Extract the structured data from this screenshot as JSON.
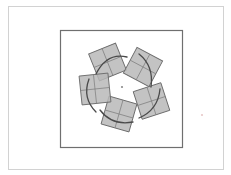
{
  "figure": {
    "canvas": {
      "width": 231,
      "height": 175,
      "background": "#ffffff"
    },
    "page_border": {
      "label": "page-border",
      "x": 8,
      "y": 6,
      "width": 215,
      "height": 163,
      "stroke": "#d2d2d2",
      "stroke_width": 1,
      "fill": "none"
    },
    "inner_frame": {
      "label": "inner-frame",
      "x": 60.5,
      "y": 30.5,
      "width": 122,
      "height": 117,
      "stroke": "#6f6f6f",
      "stroke_width": 1.2,
      "fill": "none"
    },
    "center_point": {
      "label": "center-marker",
      "cx": 122,
      "cy": 87,
      "r": 1.1,
      "color": "#8a8a8a"
    },
    "stray_point": {
      "label": "stray-marker",
      "cx": 202,
      "cy": 115,
      "r": 1.1,
      "color": "#e8c8c8"
    },
    "style": {
      "square_fill": "#b9b9b9",
      "square_fill_opacity": 0.85,
      "square_stroke": "#6b6b6b",
      "square_stroke_width": 0.9,
      "divider_stroke": "#7d7d7d",
      "divider_stroke_width": 0.7,
      "arc_stroke": "#4a4a4a",
      "arc_stroke_width": 1.3
    },
    "squares": [
      {
        "name": "square-top",
        "cx": 107.5,
        "cy": 62.0,
        "size": 29,
        "rotation": -22,
        "arc_sweep": 0
      },
      {
        "name": "square-upper-right",
        "cx": 143.0,
        "cy": 67.0,
        "size": 29,
        "rotation": 28,
        "arc_sweep": 0
      },
      {
        "name": "square-right",
        "cx": 151.5,
        "cy": 101.0,
        "size": 29,
        "rotation": -18,
        "arc_sweep": 0
      },
      {
        "name": "square-bottom",
        "cx": 119.0,
        "cy": 114.0,
        "size": 29,
        "rotation": 16,
        "arc_sweep": 0
      },
      {
        "name": "square-left",
        "cx": 95.0,
        "cy": 89.0,
        "size": 29,
        "rotation": -6,
        "arc_sweep": 0
      }
    ],
    "arcs": [
      {
        "name": "arc-top",
        "d": "M 96 74 Q 107 52 127 57"
      },
      {
        "name": "arc-upper-right",
        "d": "M 139 54 Q 154 66 151 87"
      },
      {
        "name": "arc-right",
        "d": "M 160 89 Q 158 110 139 118"
      },
      {
        "name": "arc-bottom",
        "d": "M 133 122 Q 112 126 100 110"
      },
      {
        "name": "arc-left",
        "d": "M 96 112 Q 82 98 89 79"
      }
    ]
  }
}
